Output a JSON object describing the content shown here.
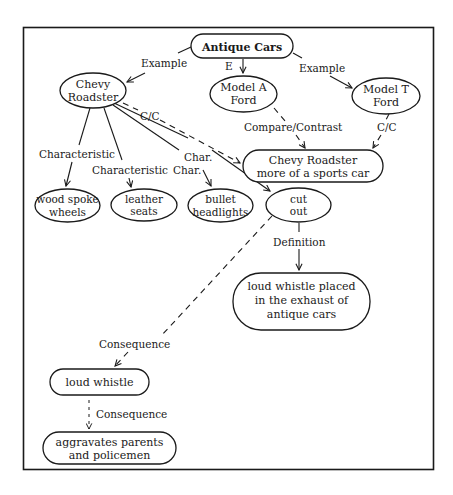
{
  "diagram": {
    "type": "concept-map",
    "colors": {
      "ink": "#1a1a1a",
      "background": "#ffffff"
    },
    "nodes": {
      "antique_cars": {
        "lines": [
          "Antique Cars"
        ]
      },
      "chevy_roadster": {
        "lines": [
          "Chevy",
          "Roadster"
        ]
      },
      "model_a": {
        "lines": [
          "Model A",
          "Ford"
        ]
      },
      "model_t": {
        "lines": [
          "Model T",
          "Ford"
        ]
      },
      "sports_car": {
        "lines": [
          "Chevy Roadster",
          "more of a sports car"
        ]
      },
      "wood_spoke": {
        "lines": [
          "wood spoke",
          "wheels"
        ]
      },
      "leather_seats": {
        "lines": [
          "leather",
          "seats"
        ]
      },
      "bullet_headlights": {
        "lines": [
          "bullet",
          "headlights"
        ]
      },
      "cut_out": {
        "lines": [
          "cut",
          "out"
        ]
      },
      "definition_box": {
        "lines": [
          "loud whistle placed",
          "in the exhaust of",
          "antique cars"
        ]
      },
      "loud_whistle": {
        "lines": [
          "loud whistle"
        ]
      },
      "aggravates": {
        "lines": [
          "aggravates parents",
          "and policemen"
        ]
      }
    },
    "edge_labels": {
      "example_left": "Example",
      "example_mid": "E",
      "example_right": "Example",
      "cc_chevy": "C/C",
      "compare_contrast": "Compare/Contrast",
      "cc_model_t": "C/C",
      "characteristic_1": "Characteristic",
      "characteristic_2": "Characteristic",
      "char_1": "Char.",
      "char_2": "Char.",
      "definition": "Definition",
      "consequence_1": "Consequence",
      "consequence_2": "Consequence"
    }
  }
}
